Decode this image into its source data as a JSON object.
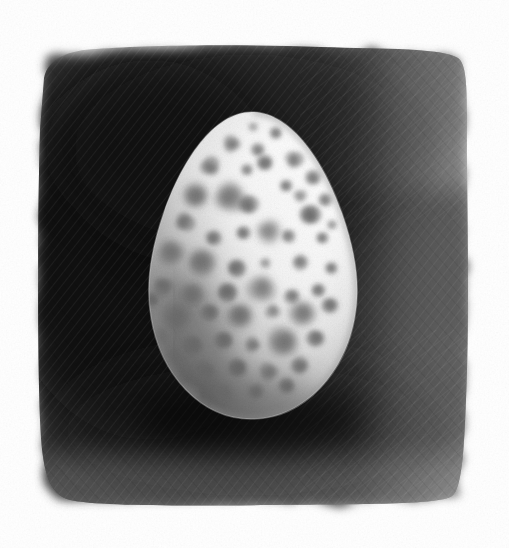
{
  "artwork": {
    "title": "Speckled Egg",
    "medium": "graphite pencil drawing",
    "subject": "single speckled bird egg",
    "orientation": "portrait",
    "canvas": {
      "width": 509,
      "height": 548,
      "paper_color": "#ffffff"
    }
  },
  "background_panel": {
    "name": "dark hatched rectangular field",
    "bounds": {
      "x": 38,
      "y": 46,
      "width": 430,
      "height": 462
    },
    "darkest_color": "#1c1c1c",
    "mid_color": "#3d3d3d",
    "light_corner_color": "#6d6d6d",
    "edge_style": "rough torn pencil edge fading to paper",
    "hatching": "diagonal graphite strokes visible at corners"
  },
  "egg": {
    "name": "speckled egg",
    "shape": "pyriform oval, narrow at top",
    "bounds": {
      "cx": 253,
      "cy": 268,
      "rx": 103,
      "ry": 156
    },
    "highlight_color": "#fbfbfb",
    "body_color": "#e8e8e8",
    "shadow_color": "#6f6f6f",
    "rim_color": "#8d8d8d",
    "light_direction": "upper right",
    "shadow_side": "lower left",
    "speckle_color": "#9a9a9a",
    "speckle_dark_color": "#6a6a6a",
    "speckle_count": 58,
    "speckles": [
      {
        "cx": 232,
        "cy": 144,
        "r": 8,
        "t": 0.55
      },
      {
        "cx": 258,
        "cy": 150,
        "r": 6,
        "t": 0.45
      },
      {
        "cx": 276,
        "cy": 133,
        "r": 5,
        "t": 0.4
      },
      {
        "cx": 210,
        "cy": 167,
        "r": 9,
        "t": 0.55
      },
      {
        "cx": 247,
        "cy": 170,
        "r": 5,
        "t": 0.42
      },
      {
        "cx": 265,
        "cy": 163,
        "r": 7,
        "t": 0.48
      },
      {
        "cx": 294,
        "cy": 160,
        "r": 8,
        "t": 0.5
      },
      {
        "cx": 313,
        "cy": 178,
        "r": 7,
        "t": 0.46
      },
      {
        "cx": 196,
        "cy": 196,
        "r": 10,
        "t": 0.58
      },
      {
        "cx": 229,
        "cy": 197,
        "r": 13,
        "t": 0.58
      },
      {
        "cx": 248,
        "cy": 205,
        "r": 9,
        "t": 0.5
      },
      {
        "cx": 286,
        "cy": 186,
        "r": 5,
        "t": 0.4
      },
      {
        "cx": 300,
        "cy": 196,
        "r": 6,
        "t": 0.44
      },
      {
        "cx": 325,
        "cy": 200,
        "r": 6,
        "t": 0.44
      },
      {
        "cx": 310,
        "cy": 215,
        "r": 9,
        "t": 0.5
      },
      {
        "cx": 184,
        "cy": 222,
        "r": 9,
        "t": 0.56
      },
      {
        "cx": 213,
        "cy": 238,
        "r": 7,
        "t": 0.5
      },
      {
        "cx": 243,
        "cy": 233,
        "r": 6,
        "t": 0.44
      },
      {
        "cx": 268,
        "cy": 231,
        "r": 10,
        "t": 0.52
      },
      {
        "cx": 288,
        "cy": 236,
        "r": 6,
        "t": 0.44
      },
      {
        "cx": 322,
        "cy": 238,
        "r": 5,
        "t": 0.42
      },
      {
        "cx": 171,
        "cy": 252,
        "r": 11,
        "t": 0.6
      },
      {
        "cx": 201,
        "cy": 262,
        "r": 12,
        "t": 0.58
      },
      {
        "cx": 236,
        "cy": 268,
        "r": 8,
        "t": 0.48
      },
      {
        "cx": 265,
        "cy": 263,
        "r": 5,
        "t": 0.4
      },
      {
        "cx": 300,
        "cy": 262,
        "r": 7,
        "t": 0.44
      },
      {
        "cx": 331,
        "cy": 268,
        "r": 5,
        "t": 0.42
      },
      {
        "cx": 163,
        "cy": 286,
        "r": 9,
        "t": 0.6
      },
      {
        "cx": 192,
        "cy": 294,
        "r": 10,
        "t": 0.58
      },
      {
        "cx": 227,
        "cy": 292,
        "r": 9,
        "t": 0.5
      },
      {
        "cx": 262,
        "cy": 288,
        "r": 12,
        "t": 0.52
      },
      {
        "cx": 292,
        "cy": 296,
        "r": 7,
        "t": 0.45
      },
      {
        "cx": 318,
        "cy": 290,
        "r": 6,
        "t": 0.44
      },
      {
        "cx": 177,
        "cy": 317,
        "r": 12,
        "t": 0.62
      },
      {
        "cx": 210,
        "cy": 312,
        "r": 8,
        "t": 0.54
      },
      {
        "cx": 240,
        "cy": 315,
        "r": 10,
        "t": 0.52
      },
      {
        "cx": 273,
        "cy": 311,
        "r": 7,
        "t": 0.46
      },
      {
        "cx": 303,
        "cy": 313,
        "r": 11,
        "t": 0.5
      },
      {
        "cx": 330,
        "cy": 305,
        "r": 7,
        "t": 0.46
      },
      {
        "cx": 158,
        "cy": 338,
        "r": 10,
        "t": 0.64
      },
      {
        "cx": 193,
        "cy": 345,
        "r": 9,
        "t": 0.6
      },
      {
        "cx": 224,
        "cy": 340,
        "r": 8,
        "t": 0.54
      },
      {
        "cx": 253,
        "cy": 345,
        "r": 7,
        "t": 0.5
      },
      {
        "cx": 284,
        "cy": 342,
        "r": 13,
        "t": 0.52
      },
      {
        "cx": 316,
        "cy": 338,
        "r": 8,
        "t": 0.48
      },
      {
        "cx": 171,
        "cy": 366,
        "r": 11,
        "t": 0.66
      },
      {
        "cx": 205,
        "cy": 372,
        "r": 9,
        "t": 0.62
      },
      {
        "cx": 238,
        "cy": 368,
        "r": 8,
        "t": 0.56
      },
      {
        "cx": 269,
        "cy": 372,
        "r": 9,
        "t": 0.52
      },
      {
        "cx": 300,
        "cy": 366,
        "r": 8,
        "t": 0.5
      },
      {
        "cx": 190,
        "cy": 392,
        "r": 9,
        "t": 0.66
      },
      {
        "cx": 223,
        "cy": 394,
        "r": 8,
        "t": 0.6
      },
      {
        "cx": 256,
        "cy": 392,
        "r": 7,
        "t": 0.55
      },
      {
        "cx": 287,
        "cy": 386,
        "r": 7,
        "t": 0.5
      },
      {
        "cx": 253,
        "cy": 127,
        "r": 4,
        "t": 0.38
      },
      {
        "cx": 332,
        "cy": 225,
        "r": 4,
        "t": 0.38
      },
      {
        "cx": 152,
        "cy": 300,
        "r": 6,
        "t": 0.62
      },
      {
        "cx": 215,
        "cy": 412,
        "r": 6,
        "t": 0.6
      }
    ]
  },
  "caption": {
    "text": "Speckled Egg"
  }
}
